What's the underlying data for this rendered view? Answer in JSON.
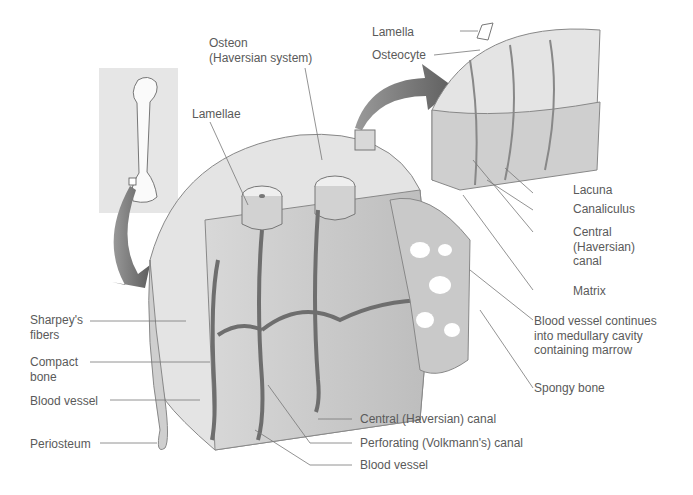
{
  "diagram": {
    "labels": {
      "osteon_line1": "Osteon",
      "osteon_line2": "(Haversian system)",
      "lamellae": "Lamellae",
      "lamella": "Lamella",
      "osteocyte": "Osteocyte",
      "lacuna": "Lacuna",
      "canaliculus": "Canaliculus",
      "central_canal_line1": "Central",
      "central_canal_line2": "(Haversian)",
      "central_canal_line3": "canal",
      "matrix": "Matrix",
      "blood_vessel_cont_line1": "Blood vessel continues",
      "blood_vessel_cont_line2": "into medullary cavity",
      "blood_vessel_cont_line3": "containing marrow",
      "spongy_bone": "Spongy bone",
      "sharpeys_line1": "Sharpey's",
      "sharpeys_line2": "fibers",
      "compact_line1": "Compact",
      "compact_line2": "bone",
      "blood_vessel_left": "Blood vessel",
      "periosteum": "Periosteum",
      "central_canal_bottom": "Central (Haversian) canal",
      "perforating_canal": "Perforating (Volkmann's) canal",
      "blood_vessel_bottom": "Blood vessel"
    }
  }
}
